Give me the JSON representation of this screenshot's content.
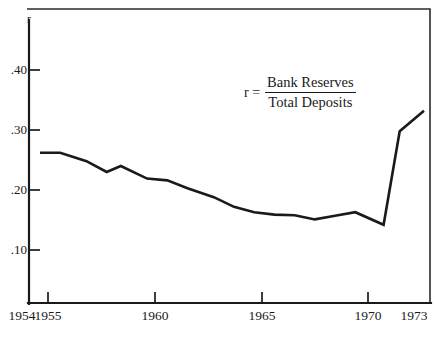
{
  "figure": {
    "y_axis_symbol": "r",
    "annotation": {
      "lhs": "r =",
      "numerator": "Bank Reserves",
      "denominator": "Total Deposits"
    }
  },
  "chart_data": {
    "type": "line",
    "title": "",
    "subtitle": "",
    "xlabel": "",
    "ylabel": "r",
    "xlim": [
      1954,
      1973.6
    ],
    "ylim": [
      0.06,
      0.445
    ],
    "grid": false,
    "legend": null,
    "y_tick_labels": [
      ".40",
      ".30",
      ".20",
      ".10"
    ],
    "y_tick_values": [
      0.4,
      0.3,
      0.2,
      0.1
    ],
    "x_tick_labels": [
      "1954",
      "1955",
      "1960",
      "1965",
      "1970",
      "1973"
    ],
    "x_tick_values": [
      1954,
      1955,
      1960,
      1965,
      1970,
      1973
    ],
    "annotations": [
      {
        "text": "r = Bank Reserves / Total Deposits",
        "x": 1967.0,
        "y": 0.355
      }
    ],
    "series": [
      {
        "name": "r = Bank Reserves / Total Deposits",
        "color": "#1a1a1a",
        "x": [
          1954.0,
          1955.0,
          1956.3,
          1957.3,
          1958.0,
          1959.3,
          1960.3,
          1961.3,
          1962.6,
          1963.6,
          1964.6,
          1965.6,
          1966.6,
          1967.6,
          1968.6,
          1969.6,
          1971.0,
          1971.8,
          1973.0
        ],
        "values": [
          0.262,
          0.262,
          0.248,
          0.23,
          0.24,
          0.219,
          0.216,
          0.203,
          0.188,
          0.172,
          0.163,
          0.159,
          0.158,
          0.151,
          0.157,
          0.163,
          0.142,
          0.298,
          0.332
        ]
      }
    ]
  },
  "colors": {
    "line": "#1a1a1a",
    "axis": "#1a1a1a",
    "frame": "#2b2b2b",
    "background": "#ffffff"
  }
}
